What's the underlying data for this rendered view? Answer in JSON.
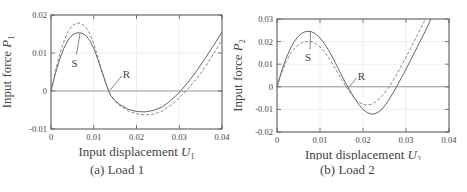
{
  "chart_data": [
    {
      "type": "line",
      "caption": "(a) Load 1",
      "xlabel": "Input displacement U",
      "xlabel_subscript": "1",
      "ylabel": "Input force P",
      "ylabel_subscript": "1",
      "xlim": [
        0,
        0.04
      ],
      "ylim": [
        -0.01,
        0.02
      ],
      "xticks": [
        "0",
        "0.01",
        "0.02",
        "0.03",
        "0.04"
      ],
      "yticks": [
        "-0.01",
        "0",
        "0.01",
        "0.02"
      ],
      "grid": true,
      "annotations": [
        {
          "text": "S",
          "x": 0.0055,
          "y": 0.0075,
          "target_x": 0.0068,
          "target_y": 0.0152
        },
        {
          "text": "R",
          "x": 0.0175,
          "y": 0.0045,
          "target_x": 0.0138,
          "target_y": 0.0002
        }
      ],
      "series": [
        {
          "name": "solid",
          "style": "solid",
          "x": [
            0,
            0.001,
            0.002,
            0.003,
            0.004,
            0.005,
            0.006,
            0.007,
            0.008,
            0.009,
            0.01,
            0.011,
            0.012,
            0.013,
            0.0135,
            0.014,
            0.015,
            0.016,
            0.018,
            0.02,
            0.022,
            0.024,
            0.026,
            0.028,
            0.03,
            0.032,
            0.034,
            0.036,
            0.038,
            0.04
          ],
          "y": [
            0,
            0.0045,
            0.0082,
            0.0112,
            0.0134,
            0.0148,
            0.0153,
            0.0153,
            0.0148,
            0.0134,
            0.0112,
            0.0082,
            0.0048,
            0.0015,
            0.0,
            -0.0012,
            -0.0025,
            -0.0035,
            -0.0048,
            -0.0054,
            -0.0055,
            -0.0051,
            -0.0042,
            -0.0025,
            -0.0004,
            0.0022,
            0.0052,
            0.0085,
            0.0119,
            0.0155
          ]
        },
        {
          "name": "dashed",
          "style": "dashed",
          "x": [
            0,
            0.001,
            0.002,
            0.003,
            0.004,
            0.005,
            0.006,
            0.007,
            0.008,
            0.009,
            0.01,
            0.011,
            0.012,
            0.013,
            0.0135,
            0.014,
            0.015,
            0.016,
            0.018,
            0.02,
            0.022,
            0.024,
            0.026,
            0.028,
            0.03,
            0.032,
            0.034,
            0.036,
            0.038,
            0.04
          ],
          "y": [
            0,
            0.0052,
            0.0095,
            0.013,
            0.0157,
            0.0173,
            0.0179,
            0.0178,
            0.017,
            0.0152,
            0.0124,
            0.0088,
            0.005,
            0.0015,
            0.0,
            -0.0013,
            -0.0027,
            -0.0038,
            -0.0052,
            -0.006,
            -0.0063,
            -0.0061,
            -0.0053,
            -0.0038,
            -0.0018,
            0.0005,
            0.0032,
            0.0062,
            0.0097,
            0.0135
          ]
        }
      ]
    },
    {
      "type": "line",
      "caption": "(b) Load 2",
      "xlabel": "Input displacement U",
      "xlabel_subscript": "2",
      "ylabel": "Input force P",
      "ylabel_subscript": "2",
      "xlim": [
        0,
        0.04
      ],
      "ylim": [
        -0.02,
        0.03
      ],
      "xticks": [
        "0",
        "0.01",
        "0.02",
        "0.03",
        "0.04"
      ],
      "yticks": [
        "-0.02",
        "-0.01",
        "0",
        "0.01",
        "0.02",
        "0.03"
      ],
      "grid": true,
      "annotations": [
        {
          "text": "S",
          "x": 0.0072,
          "y": 0.013,
          "target_x": 0.0078,
          "target_y": 0.0245
        },
        {
          "text": "R",
          "x": 0.0195,
          "y": 0.005,
          "target_x": 0.0168,
          "target_y": 0.0
        }
      ],
      "series": [
        {
          "name": "solid",
          "style": "solid",
          "x": [
            0,
            0.001,
            0.002,
            0.003,
            0.004,
            0.005,
            0.006,
            0.007,
            0.008,
            0.009,
            0.01,
            0.011,
            0.012,
            0.013,
            0.014,
            0.015,
            0.016,
            0.017,
            0.018,
            0.019,
            0.02,
            0.021,
            0.022,
            0.023,
            0.024,
            0.025,
            0.026,
            0.027,
            0.028,
            0.029,
            0.03,
            0.031,
            0.032,
            0.033,
            0.034,
            0.035,
            0.0358
          ],
          "y": [
            0,
            0.0065,
            0.012,
            0.0165,
            0.02,
            0.0225,
            0.024,
            0.0246,
            0.0244,
            0.0234,
            0.0216,
            0.0192,
            0.0162,
            0.0127,
            0.009,
            0.0052,
            0.0015,
            -0.0018,
            -0.005,
            -0.0078,
            -0.01,
            -0.0115,
            -0.0121,
            -0.0118,
            -0.0106,
            -0.0085,
            -0.0058,
            -0.0027,
            0.0007,
            0.0042,
            0.0078,
            0.0115,
            0.0153,
            0.019,
            0.0228,
            0.0267,
            0.03
          ]
        },
        {
          "name": "dashed",
          "style": "dashed",
          "x": [
            0,
            0.001,
            0.002,
            0.003,
            0.004,
            0.005,
            0.006,
            0.007,
            0.008,
            0.009,
            0.01,
            0.011,
            0.012,
            0.013,
            0.014,
            0.015,
            0.016,
            0.017,
            0.018,
            0.019,
            0.02,
            0.021,
            0.022,
            0.023,
            0.024,
            0.025,
            0.026,
            0.027,
            0.028,
            0.029,
            0.03,
            0.031,
            0.032,
            0.033,
            0.034,
            0.0345
          ],
          "y": [
            0,
            0.0058,
            0.0105,
            0.0142,
            0.0168,
            0.0186,
            0.0197,
            0.0201,
            0.0199,
            0.0191,
            0.0176,
            0.0155,
            0.0129,
            0.0099,
            0.0066,
            0.0033,
            0.0002,
            -0.0025,
            -0.005,
            -0.0068,
            -0.0078,
            -0.0081,
            -0.0077,
            -0.0066,
            -0.0049,
            -0.0027,
            -0.0002,
            0.0028,
            0.006,
            0.0095,
            0.0131,
            0.0168,
            0.0205,
            0.0242,
            0.028,
            0.03
          ]
        }
      ]
    }
  ],
  "panels": [
    {
      "caption": "(a) Load 1"
    },
    {
      "caption": "(b) Load 2"
    }
  ]
}
